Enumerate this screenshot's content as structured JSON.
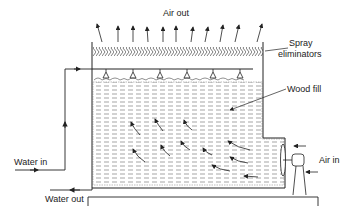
{
  "diagram": {
    "labels": {
      "air_out": "Air out",
      "spray": "Spray",
      "eliminators": "eliminators",
      "wood_fill": "Wood fill",
      "water_in": "Water in",
      "water_out": "Water out",
      "air_in": "Air in"
    },
    "components": [
      "spray-eliminators",
      "spray-nozzles",
      "wood-fill",
      "fan",
      "motor",
      "basin",
      "water-inlet-pipe",
      "water-outlet-pipe"
    ],
    "colors": {
      "line": "#222222",
      "fill_hatch": "#555555",
      "background": "#ffffff"
    }
  }
}
